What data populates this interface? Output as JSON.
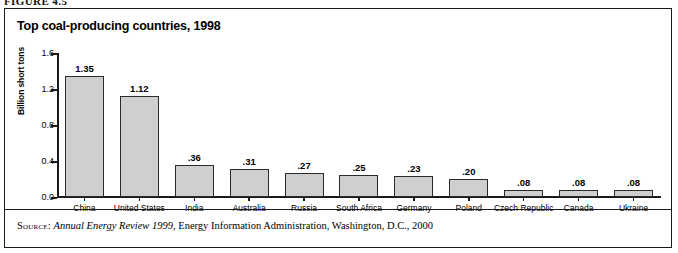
{
  "figure": {
    "label": "FIGURE 4.5"
  },
  "chart": {
    "title": "Top coal-producing countries, 1998"
  },
  "source": {
    "kicker": "Source:",
    "publication": "Annual Energy Review 1999",
    "rest": ", Energy Information Administration, Washington, D.C., 2000"
  },
  "chart_data": {
    "type": "bar",
    "title": "Top coal-producing countries, 1998",
    "xlabel": "",
    "ylabel": "Billion short tons",
    "ylim": [
      0.0,
      1.6
    ],
    "yticks": [
      "0.0",
      "0.4",
      "0.8",
      "1.2",
      "1.6"
    ],
    "ytick_values": [
      0.0,
      0.4,
      0.8,
      1.2,
      1.6
    ],
    "grid": false,
    "legend": "none",
    "categories": [
      "China",
      "United States",
      "India",
      "Australia",
      "Russia",
      "South Africa",
      "Germany",
      "Poland",
      "Czech Republic",
      "Canada",
      "Ukraine"
    ],
    "values": [
      1.35,
      1.12,
      0.36,
      0.31,
      0.27,
      0.25,
      0.23,
      0.2,
      0.08,
      0.08,
      0.08
    ],
    "value_labels": [
      "1.35",
      "1.12",
      ".36",
      ".31",
      ".27",
      ".25",
      ".23",
      ".20",
      ".08",
      ".08",
      ".08"
    ],
    "bar_color": "#cfcfcf",
    "bar_edge_color": "#2b2b2b"
  }
}
